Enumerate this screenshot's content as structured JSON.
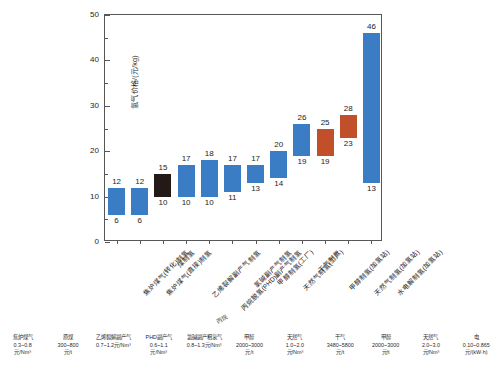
{
  "chart_data": {
    "type": "bar",
    "title": "",
    "xlabel": "",
    "ylabel": "氢气价格/(元/kg)",
    "ylim": [
      0,
      50
    ],
    "yticks": [
      0,
      10,
      20,
      30,
      40,
      50
    ],
    "ytick_labels": [
      "0",
      "10",
      "20",
      "30",
      "40",
      "50"
    ],
    "minor_yticks": [
      5,
      15,
      25,
      35,
      45
    ],
    "grid": false,
    "legend_position": "none",
    "note": "Floating (range) bar chart: each bar spans from a low price to a high price.",
    "categories": [
      "焦炉煤气(转化)制氢",
      "焦炉煤气(直接)制氢",
      "煤制氢",
      "乙烯裂解副产气制氢",
      "丙烷脱氢(PHD)副产气制氢",
      "氯碱副产气制氢",
      "甲醇制氢(工厂)",
      "天然气制氢(工厂)",
      "干气制氢",
      "甲醇制氢(加氢站)",
      "天然气制氢(加氢站)",
      "水电解制氢(加氢站)"
    ],
    "series": [
      {
        "name": "氢气价格区间",
        "low": [
          6,
          6,
          10,
          10,
          10,
          11,
          13,
          14,
          19,
          19,
          23,
          13
        ],
        "high": [
          12,
          12,
          15,
          17,
          18,
          17,
          17,
          20,
          26,
          25,
          28,
          46
        ],
        "colors": [
          "#3b7dc4",
          "#3b7dc4",
          "#231a17",
          "#3b7dc4",
          "#3b7dc4",
          "#3b7dc4",
          "#3b7dc4",
          "#3b7dc4",
          "#3b7dc4",
          "#c1502a",
          "#c1502a",
          "#3b7dc4"
        ]
      }
    ],
    "colors": {
      "blue": "#3b7dc4",
      "dark": "#231a17",
      "orange": "#c1502a",
      "axis": "#575757",
      "text": "#1d1d1d"
    }
  },
  "feedstock_legend": [
    {
      "name": "焦炉煤气",
      "value": "0.3~0.8",
      "unit": "元/Nm³"
    },
    {
      "name": "原煤",
      "value": "300~800",
      "unit": "元/t"
    },
    {
      "name": "乙烯裂解副产气",
      "value": "0.7~1.2元/Nm³",
      "unit": ""
    },
    {
      "name": "PHD副产气",
      "value": "0.6~1.1",
      "unit": "元/Nm³"
    },
    {
      "name": "氯碱副产粗氢气",
      "value": "0.8~1.3元/Nm³",
      "unit": ""
    },
    {
      "name": "甲醇",
      "value": "2000~3000",
      "unit": "元/t"
    },
    {
      "name": "天然气",
      "value": "1.0~2.0",
      "unit": "元/Nm³"
    },
    {
      "name": "干气",
      "value": "3480~5800",
      "unit": "元/t"
    },
    {
      "name": "甲醇",
      "value": "2000~3000",
      "unit": "元/t"
    },
    {
      "name": "天然气",
      "value": "2.0~3.0",
      "unit": "元/Nm³"
    },
    {
      "name": "电",
      "value": "0.10~0.865",
      "unit": "元/(kW·h)"
    }
  ],
  "legend_extra_label": "丙烷"
}
